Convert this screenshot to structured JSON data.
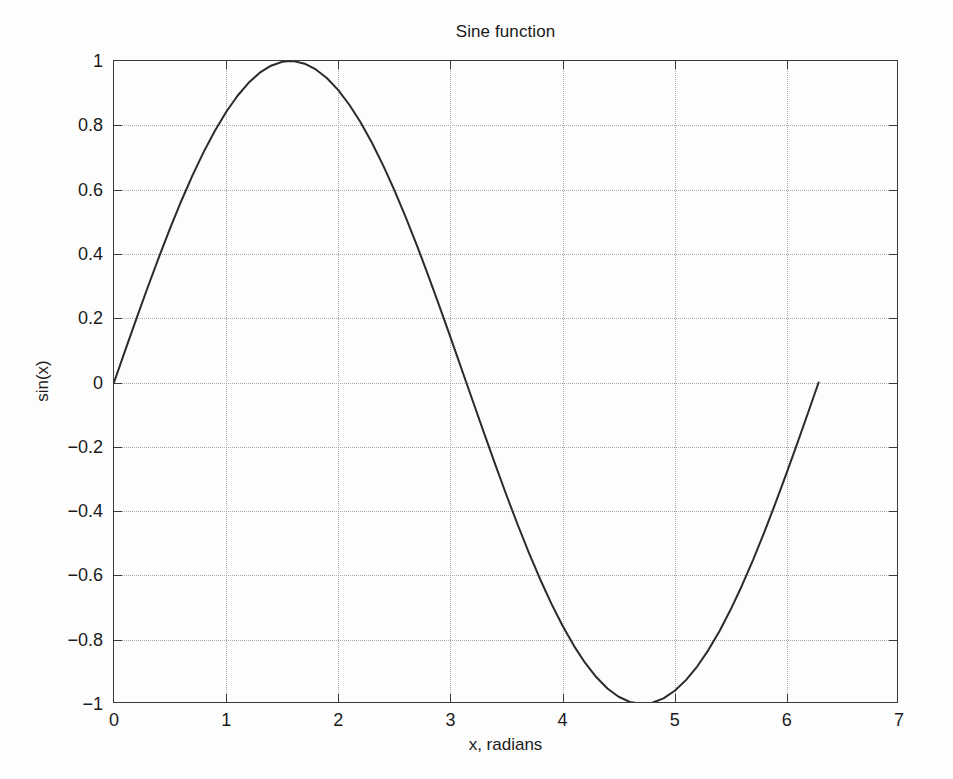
{
  "chart_data": {
    "type": "line",
    "title": "Sine function",
    "xlabel": "x, radians",
    "ylabel": "sin(x)",
    "xlim": [
      0,
      7
    ],
    "ylim": [
      -1,
      1
    ],
    "xticks": [
      0,
      1,
      2,
      3,
      4,
      5,
      6,
      7
    ],
    "xticklabels": [
      "0",
      "1",
      "2",
      "3",
      "4",
      "5",
      "6",
      "7"
    ],
    "yticks": [
      -1,
      -0.8,
      -0.6,
      -0.4,
      -0.2,
      0,
      0.2,
      0.4,
      0.6,
      0.8,
      1
    ],
    "yticklabels": [
      "−1",
      "−0.8",
      "−0.6",
      "−0.4",
      "−0.2",
      "0",
      "0.2",
      "0.4",
      "0.6",
      "0.8",
      "1"
    ],
    "grid": true,
    "grid_style": "dotted",
    "legend": null,
    "line_color": "#2b2b2b",
    "line_width": 2,
    "background_color": "#fdfdfd",
    "axes_color": "#3a3a3a",
    "series": [
      {
        "name": "sin(x)",
        "x": [
          0,
          0.1,
          0.2,
          0.3,
          0.4,
          0.5,
          0.6,
          0.7,
          0.8,
          0.9,
          1.0,
          1.1,
          1.2,
          1.3,
          1.4,
          1.5,
          1.5708,
          1.6,
          1.7,
          1.8,
          1.9,
          2.0,
          2.1,
          2.2,
          2.3,
          2.4,
          2.5,
          2.6,
          2.7,
          2.8,
          2.9,
          3.0,
          3.1416,
          3.2,
          3.3,
          3.4,
          3.5,
          3.6,
          3.7,
          3.8,
          3.9,
          4.0,
          4.1,
          4.2,
          4.3,
          4.4,
          4.5,
          4.6,
          4.7124,
          4.8,
          4.9,
          5.0,
          5.1,
          5.2,
          5.3,
          5.4,
          5.5,
          5.6,
          5.7,
          5.8,
          5.9,
          6.0,
          6.1,
          6.2,
          6.2832
        ],
        "y": [
          0.0,
          0.0998,
          0.1987,
          0.2955,
          0.3894,
          0.4794,
          0.5646,
          0.6442,
          0.7174,
          0.7833,
          0.8415,
          0.8912,
          0.932,
          0.9636,
          0.9854,
          0.9975,
          1.0,
          0.9996,
          0.9917,
          0.9738,
          0.9463,
          0.9093,
          0.8632,
          0.8085,
          0.7457,
          0.6755,
          0.5985,
          0.5155,
          0.4274,
          0.335,
          0.2392,
          0.1411,
          0.0,
          -0.0584,
          -0.1577,
          -0.2555,
          -0.3508,
          -0.4425,
          -0.5298,
          -0.6119,
          -0.6878,
          -0.7568,
          -0.8183,
          -0.8716,
          -0.9162,
          -0.9516,
          -0.9775,
          -0.9937,
          -1.0,
          -0.9962,
          -0.9825,
          -0.9589,
          -0.9258,
          -0.8835,
          -0.8323,
          -0.7728,
          -0.7055,
          -0.6313,
          -0.5507,
          -0.4646,
          -0.3739,
          -0.2794,
          -0.1822,
          -0.0831,
          0.0
        ]
      }
    ]
  }
}
